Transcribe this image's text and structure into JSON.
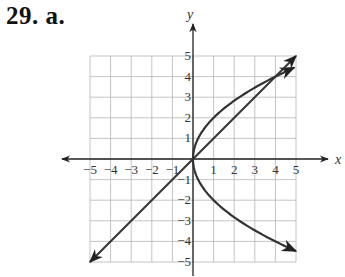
{
  "problem": {
    "label": "29. a."
  },
  "chart_data": {
    "type": "line",
    "title": "",
    "xlabel": "x",
    "ylabel": "y",
    "xlim": [
      -5,
      5
    ],
    "ylim": [
      -5,
      5
    ],
    "grid": true,
    "x_ticks": [
      "-5",
      "-4",
      "-3",
      "-2",
      "-1",
      "1",
      "2",
      "3",
      "4",
      "5"
    ],
    "y_ticks": [
      "5",
      "4",
      "3",
      "2",
      "1",
      "-1",
      "-2",
      "-3",
      "-4",
      "-5"
    ],
    "series": [
      {
        "name": "parabola y^2 = 4x",
        "x": [
          0,
          0.25,
          1,
          2.25,
          4,
          5
        ],
        "y_upper": [
          0,
          1,
          2,
          3,
          4,
          4.47
        ],
        "y_lower": [
          0,
          -1,
          -2,
          -3,
          -4,
          -4.47
        ]
      },
      {
        "name": "line y = x",
        "x": [
          -5,
          0,
          5
        ],
        "y": [
          -5,
          0,
          5
        ]
      }
    ],
    "intersections": [
      [
        0,
        0
      ],
      [
        4,
        4
      ]
    ],
    "colors": {
      "curve": "#333333",
      "grid": "#b5b5b5",
      "axis": "#222222"
    }
  }
}
